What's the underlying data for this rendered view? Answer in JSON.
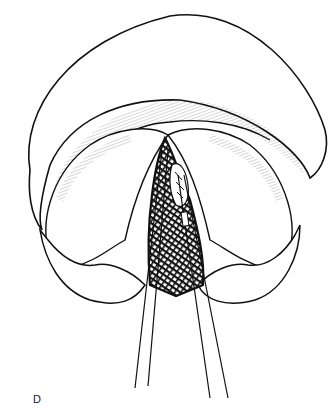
{
  "figure": {
    "panel_label": "D",
    "colors": {
      "line": "#111111",
      "background": "#ffffff"
    }
  }
}
